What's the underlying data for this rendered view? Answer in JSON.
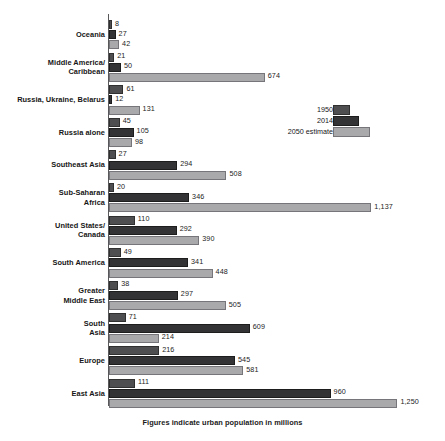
{
  "chart_data": {
    "type": "bar",
    "orientation": "horizontal",
    "title": "",
    "subtitle": "",
    "xlabel": "",
    "ylabel": "",
    "footnote": "Figures indicate urban population in millions",
    "grid": false,
    "xlim": [
      0,
      1250
    ],
    "legend_position": "middle-right",
    "legend": [
      {
        "name": "1950",
        "color": "#4e4e50"
      },
      {
        "name": "2014",
        "color": "#333335"
      },
      {
        "name": "2050 estimate",
        "color": "#a9a9ab"
      }
    ],
    "categories": [
      "Oceania",
      "Middle America/\nCaribbean",
      "Russia, Ukraine, Belarus",
      "Russia alone",
      "Southeast Asia",
      "Sub-Saharan\nAfrica",
      "United States/\nCanada",
      "South America",
      "Greater\nMiddle East",
      "South\nAsia",
      "Europe",
      "East Asia"
    ],
    "series": [
      {
        "name": "1950",
        "values": [
          8,
          21,
          61,
          45,
          27,
          20,
          110,
          49,
          38,
          71,
          216,
          111
        ]
      },
      {
        "name": "2014",
        "values": [
          27,
          50,
          12,
          105,
          294,
          346,
          292,
          341,
          297,
          609,
          545,
          960
        ]
      },
      {
        "name": "2050 estimate",
        "values": [
          42,
          674,
          131,
          98,
          508,
          1137,
          390,
          448,
          505,
          214,
          581,
          1250
        ]
      }
    ]
  },
  "categories_display": [
    {
      "lines": [
        "Oceania"
      ]
    },
    {
      "lines": [
        "Middle America/",
        "Caribbean"
      ]
    },
    {
      "lines": [
        "Russia, Ukraine, Belarus"
      ]
    },
    {
      "lines": [
        "Russia alone"
      ]
    },
    {
      "lines": [
        "Southeast Asia"
      ]
    },
    {
      "lines": [
        "Sub-Saharan",
        "Africa"
      ]
    },
    {
      "lines": [
        "United States/",
        "Canada"
      ]
    },
    {
      "lines": [
        "South America"
      ]
    },
    {
      "lines": [
        "Greater",
        "Middle East"
      ]
    },
    {
      "lines": [
        "South",
        "Asia"
      ]
    },
    {
      "lines": [
        "Europe"
      ]
    },
    {
      "lines": [
        "East Asia"
      ]
    }
  ],
  "value_labels": {
    "Oceania": [
      "8",
      "27",
      "42"
    ],
    "Middle America/Caribbean": [
      "21",
      "50",
      "674"
    ],
    "Russia, Ukraine, Belarus": [
      "61",
      "12",
      "131"
    ],
    "Russia alone": [
      "45",
      "105",
      "98"
    ],
    "Southeast Asia": [
      "27",
      "294",
      "508"
    ],
    "Sub-Saharan Africa": [
      "20",
      "346",
      "1,137"
    ],
    "United States/Canada": [
      "110",
      "292",
      "390"
    ],
    "South America": [
      "49",
      "341",
      "448"
    ],
    "Greater Middle East": [
      "38",
      "297",
      "505"
    ],
    "South Asia": [
      "71",
      "609",
      "214"
    ],
    "Europe": [
      "216",
      "545",
      "581"
    ],
    "East Asia": [
      "111",
      "960",
      "1,250"
    ]
  },
  "colors": {
    "series_1950": "#4e4e50",
    "series_2014": "#333335",
    "series_2050": "#a9a9ab",
    "axis": "#58585a",
    "text": "#1b1b1b",
    "background": "#ffffff"
  }
}
